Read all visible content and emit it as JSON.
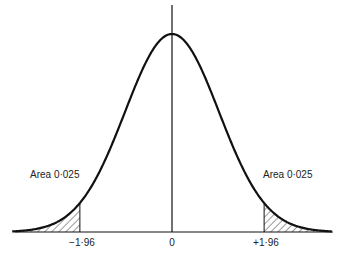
{
  "chart_data": {
    "type": "area",
    "title": "",
    "subtitle": "",
    "xlabel": "",
    "ylabel": "",
    "distribution": {
      "name": "standard normal",
      "mean": 0,
      "sd": 1
    },
    "xlim": [
      -3.4,
      3.4
    ],
    "grid": false,
    "legend": null,
    "tick_labels": [
      "-1·96",
      "0",
      "+1·96"
    ],
    "tick_values": [
      -1.96,
      0,
      1.96
    ],
    "shaded_regions": [
      {
        "from": -3.4,
        "to": -1.96,
        "area": 0.025,
        "label": "Area 0·025",
        "pattern": "hatched"
      },
      {
        "from": 1.96,
        "to": 3.4,
        "area": 0.025,
        "label": "Area 0·025",
        "pattern": "hatched"
      }
    ],
    "annotations": [
      {
        "text": "Area 0·025",
        "side": "left"
      },
      {
        "text": "Area 0·025",
        "side": "right"
      }
    ],
    "colors": {
      "curve": "#111111",
      "axis": "#111111",
      "hatch": "#333333",
      "background": "#ffffff"
    }
  },
  "labels": {
    "left_area": "Area 0·025",
    "right_area": "Area 0·025",
    "tick_left": "−1·96",
    "tick_center": "0",
    "tick_right": "+1·96"
  }
}
